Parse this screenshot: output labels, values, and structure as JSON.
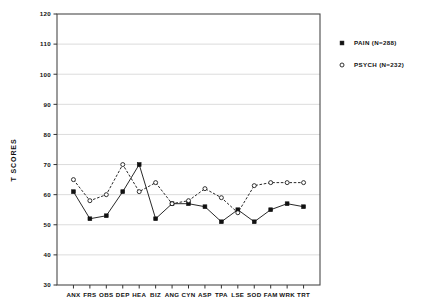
{
  "chart_data": {
    "type": "line",
    "title": "",
    "xlabel": "",
    "ylabel": "T SCORES",
    "ylim": [
      30,
      120
    ],
    "ytick_step": 10,
    "yticks": [
      30,
      40,
      50,
      60,
      70,
      80,
      90,
      100,
      110,
      120
    ],
    "grid": true,
    "grid_axis": "y",
    "legend_position": "right-outside",
    "categories": [
      "ANX",
      "FRS",
      "OBS",
      "DEP",
      "HEA",
      "BIZ",
      "ANG",
      "CYN",
      "ASP",
      "TPA",
      "LSE",
      "SOD",
      "FAM",
      "WRK",
      "TRT"
    ],
    "series": [
      {
        "name": "PAIN (N=288)",
        "marker": "filled-square",
        "color": "#111111",
        "values": [
          61,
          52,
          53,
          61,
          70,
          52,
          57,
          57,
          56,
          51,
          55,
          51,
          55,
          57,
          56
        ]
      },
      {
        "name": "PSYCH (N=232)",
        "marker": "open-circle",
        "color": "#111111",
        "values": [
          65,
          58,
          60,
          70,
          61,
          64,
          57,
          58,
          62,
          59,
          54,
          63,
          64,
          64,
          64
        ]
      }
    ]
  },
  "legend": {
    "entries": [
      {
        "label": "PAIN (N=288)",
        "marker": "filled-square"
      },
      {
        "label": "PSYCH (N=232)",
        "marker": "open-circle"
      }
    ]
  },
  "axes": {
    "y_title": "T SCORES"
  }
}
